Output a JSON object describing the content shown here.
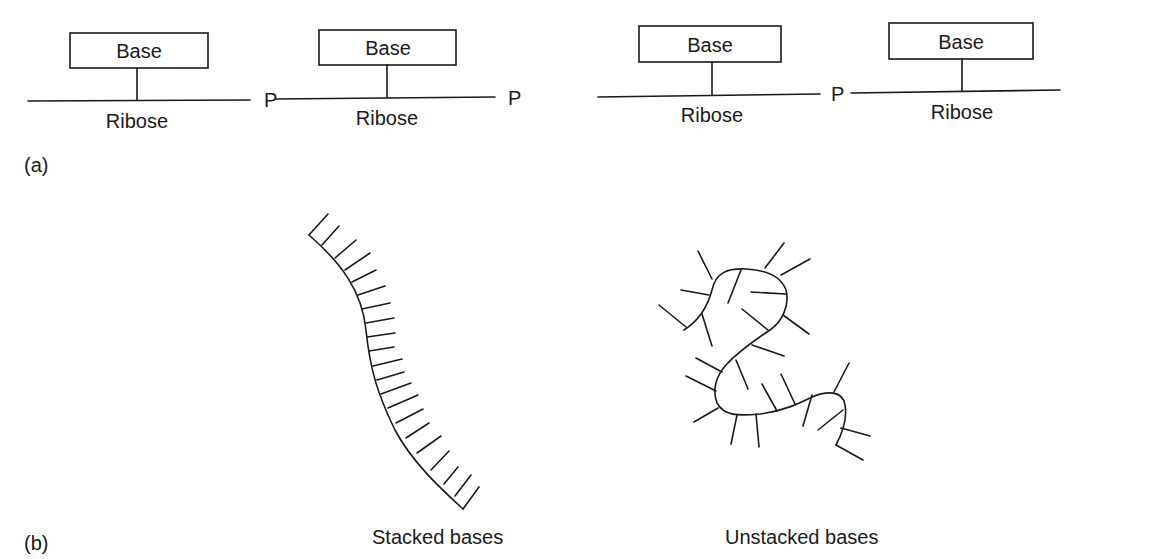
{
  "panel_a": {
    "label": "(a)",
    "units": [
      {
        "base": "Base",
        "sugar": "Ribose"
      },
      {
        "base": "Base",
        "sugar": "Ribose"
      },
      {
        "base": "Base",
        "sugar": "Ribose"
      },
      {
        "base": "Base",
        "sugar": "Ribose"
      }
    ],
    "linkers": [
      "P",
      "P",
      "P"
    ]
  },
  "panel_b": {
    "label": "(b)",
    "stacked_caption": "Stacked bases",
    "unstacked_caption": "Unstacked bases"
  }
}
